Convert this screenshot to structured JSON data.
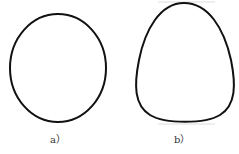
{
  "figures": [
    {
      "id": "a",
      "label": "a）",
      "shape": "ellipse"
    },
    {
      "id": "b",
      "label": "b）",
      "shape": "egg"
    }
  ],
  "colors": {
    "stroke": "#111111",
    "background": "#ffffff"
  }
}
